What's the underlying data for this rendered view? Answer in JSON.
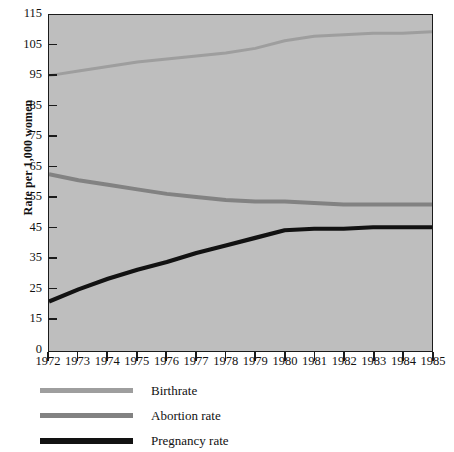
{
  "chart_data": {
    "type": "line",
    "title": "",
    "xlabel": "",
    "ylabel": "Rate per 1,000 women",
    "grid": false,
    "legend_position": "below",
    "xlim": [
      1972,
      1985
    ],
    "ylim": [
      15,
      115
    ],
    "y_axis_origin_label": "0",
    "x": [
      1972,
      1973,
      1974,
      1975,
      1976,
      1977,
      1978,
      1979,
      1980,
      1981,
      1982,
      1983,
      1984,
      1985
    ],
    "xtick_labels": [
      "1972",
      "1973",
      "1974",
      "1975",
      "1976",
      "1977",
      "1978",
      "1979",
      "1980",
      "1981",
      "1982",
      "1983",
      "1984",
      "1985"
    ],
    "ytick_labels": [
      "115",
      "105",
      "95",
      "85",
      "75",
      "65",
      "55",
      "45",
      "35",
      "25",
      "15",
      "0"
    ],
    "ytick_values": [
      115,
      105,
      95,
      85,
      75,
      65,
      55,
      45,
      35,
      25,
      15
    ],
    "series": [
      {
        "name": "Birthrate",
        "color": "#9e9e9e",
        "width": 3.0,
        "values": [
          95,
          96.5,
          98,
          99.5,
          100.5,
          101.5,
          102.5,
          104,
          106.5,
          108,
          108.5,
          109,
          109,
          109.5
        ]
      },
      {
        "name": "Abortion rate",
        "color": "#828282",
        "width": 4.0,
        "values": [
          62.5,
          60.5,
          59,
          57.5,
          56,
          55,
          54,
          53.5,
          53.5,
          53,
          52.5,
          52.5,
          52.5,
          52.5
        ]
      },
      {
        "name": "Pregnancy rate",
        "color": "#121212",
        "width": 4.2,
        "values": [
          20.5,
          24.5,
          28,
          31,
          33.5,
          36.5,
          39,
          41.5,
          44,
          44.5,
          44.5,
          45,
          45,
          45
        ]
      }
    ]
  },
  "legend": {
    "items": [
      {
        "label": "Birthrate",
        "color": "#9e9e9e",
        "thick": false
      },
      {
        "label": "Abortion rate",
        "color": "#828282",
        "thick": false
      },
      {
        "label": "Pregnancy rate",
        "color": "#121212",
        "thick": true
      }
    ]
  },
  "colors": {
    "plot_background": "#bebebe",
    "page_background": "#ffffff",
    "axis": "#1b1b1b",
    "text": "#111111"
  }
}
